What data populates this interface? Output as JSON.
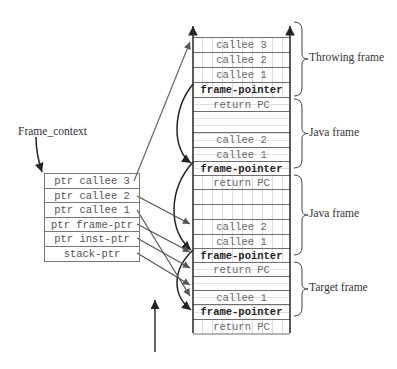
{
  "frame_context": {
    "title": "Frame_context",
    "rows": [
      "ptr callee 3",
      "ptr callee 2",
      "ptr callee 1",
      "ptr frame-ptr",
      "ptr inst-ptr",
      "stack-ptr"
    ]
  },
  "stack": {
    "cells": [
      {
        "text": "callee 3",
        "top": 0,
        "h": 15,
        "style": "dashed-v",
        "bold": false
      },
      {
        "text": "callee 2",
        "top": 15,
        "h": 15,
        "style": "dashed-v",
        "bold": false
      },
      {
        "text": "callee 1",
        "top": 30,
        "h": 15,
        "style": "dashed-v",
        "bold": false
      },
      {
        "text": "frame-pointer",
        "top": 45,
        "h": 15,
        "style": "dashed-v",
        "bold": true
      },
      {
        "text": "return PC",
        "top": 60,
        "h": 14,
        "style": "dashed-h",
        "bold": false
      },
      {
        "text": "",
        "top": 74,
        "h": 21,
        "style": "dashed-h",
        "bold": false
      },
      {
        "text": "callee 2",
        "top": 95,
        "h": 15,
        "style": "dashed-h",
        "bold": false
      },
      {
        "text": "callee 1",
        "top": 110,
        "h": 14,
        "style": "dashed-h",
        "bold": false
      },
      {
        "text": "frame-pointer",
        "top": 124,
        "h": 14,
        "style": "dashed-h",
        "bold": true
      },
      {
        "text": "return PC",
        "top": 138,
        "h": 14,
        "style": "dashed-v",
        "bold": false
      },
      {
        "text": "",
        "top": 152,
        "h": 15,
        "style": "dashed-v",
        "bold": false
      },
      {
        "text": "",
        "top": 167,
        "h": 15,
        "style": "dashed-v",
        "bold": false
      },
      {
        "text": "callee 2",
        "top": 182,
        "h": 15,
        "style": "dashed-v",
        "bold": false
      },
      {
        "text": "callee 1",
        "top": 197,
        "h": 14,
        "style": "dashed-v",
        "bold": false
      },
      {
        "text": "frame-pointer",
        "top": 211,
        "h": 14,
        "style": "dashed-v",
        "bold": true
      },
      {
        "text": "return PC",
        "top": 225,
        "h": 14,
        "style": "dashed-h",
        "bold": false
      },
      {
        "text": "",
        "top": 239,
        "h": 14,
        "style": "dashed-h",
        "bold": false
      },
      {
        "text": "callee 1",
        "top": 253,
        "h": 14,
        "style": "dashed-h",
        "bold": false
      },
      {
        "text": "frame-pointer",
        "top": 267,
        "h": 15,
        "style": "dashed-h",
        "bold": true
      },
      {
        "text": "return PC",
        "top": 282,
        "h": 15,
        "style": "dashed-v",
        "bold": false
      }
    ]
  },
  "frames": [
    {
      "label": "Throwing frame",
      "top": 22,
      "bottom": 96
    },
    {
      "label": "Java frame",
      "top": 99,
      "bottom": 168
    },
    {
      "label": "Java frame",
      "top": 175,
      "bottom": 255
    },
    {
      "label": "Target frame",
      "top": 262,
      "bottom": 316
    }
  ]
}
